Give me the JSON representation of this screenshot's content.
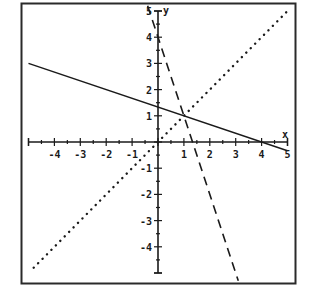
{
  "chart_data": {
    "type": "line",
    "title": "",
    "xlabel": "x",
    "ylabel": "y",
    "xlim": [
      -5,
      5
    ],
    "ylim": [
      -5,
      5
    ],
    "grid": false,
    "legend": null,
    "x_ticks": [
      -4,
      -3,
      -2,
      -1,
      1,
      2,
      3,
      4,
      5
    ],
    "y_ticks": [
      5,
      4,
      3,
      2,
      1,
      -1,
      -2,
      -3,
      -4
    ],
    "minor_tick_step": 0.5,
    "series": [
      {
        "name": "solid line",
        "style": "solid",
        "equation": "y = -x/3 + 4/3",
        "points": [
          [
            -5,
            3
          ],
          [
            4,
            0
          ],
          [
            5,
            -0.333
          ]
        ]
      },
      {
        "name": "dashed line",
        "style": "dashed",
        "equation": "y = -3x + 4",
        "points": [
          [
            -0.4,
            5.2
          ],
          [
            1.333,
            0
          ],
          [
            3.1,
            -5.3
          ]
        ]
      },
      {
        "name": "dotted line",
        "style": "dotted",
        "equation": "y = x",
        "points": [
          [
            -4.8,
            -4.8
          ],
          [
            0,
            0
          ],
          [
            5,
            5
          ]
        ]
      }
    ],
    "annotations": [
      {
        "text": "intersection",
        "x": 1,
        "y": 1
      }
    ]
  },
  "labels": {
    "x_axis": "x",
    "y_axis": "y",
    "x_tick_labels": [
      "-4",
      "-3",
      "-2",
      "-1",
      "1",
      "2",
      "3",
      "4",
      "5"
    ],
    "y_tick_labels": [
      "5",
      "4",
      "3",
      "2",
      "1",
      "-1",
      "-2",
      "-3",
      "-4"
    ]
  },
  "colors": {
    "ink": "#1a1a1a",
    "background": "#ffffff"
  }
}
